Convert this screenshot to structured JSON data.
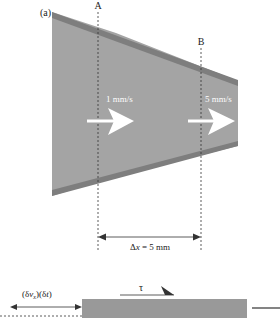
{
  "figure": {
    "panel_label": "(a)",
    "section_a_label": "A",
    "section_b_label": "B",
    "velocity_a": "1 mm/s",
    "velocity_b": "5 mm/s",
    "dx_prefix": "Δ",
    "dx_var": "x",
    "dx_suffix": " = 5 mm",
    "shear_symbol": "τ",
    "disp_open1": "(δ",
    "disp_var1": "v",
    "disp_sub": "x",
    "disp_mid": ")(δ",
    "disp_var2": "t",
    "disp_close": ")"
  },
  "colors": {
    "channel_fill": "#a4a4a4",
    "channel_edge": "#7e7e7e",
    "arrow": "#ffffff",
    "line": "#333333",
    "block": "#999999"
  }
}
